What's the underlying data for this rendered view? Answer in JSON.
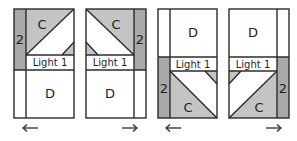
{
  "colors": {
    "strip": "#a9a9a9",
    "triangle": "#c4c4c4",
    "background": "#ffffff",
    "line": "#2b2b2b"
  },
  "panels": [
    {
      "id": "panel-1",
      "strip_label": "2",
      "triangle_label": "C",
      "band_label": "Light 1",
      "square_label": "D",
      "arrow": "left",
      "arrow_glyph": "←"
    },
    {
      "id": "panel-2",
      "strip_label": "2",
      "triangle_label": "C",
      "band_label": "Light 1",
      "square_label": "D",
      "arrow": "right",
      "arrow_glyph": "→"
    },
    {
      "id": "panel-3",
      "strip_label": "2",
      "triangle_label": "C",
      "band_label": "Light 1",
      "square_label": "D",
      "arrow": "left",
      "arrow_glyph": "←"
    },
    {
      "id": "panel-4",
      "strip_label": "2",
      "triangle_label": "C",
      "band_label": "Light 1",
      "square_label": "D",
      "arrow": "right",
      "arrow_glyph": "→"
    }
  ]
}
